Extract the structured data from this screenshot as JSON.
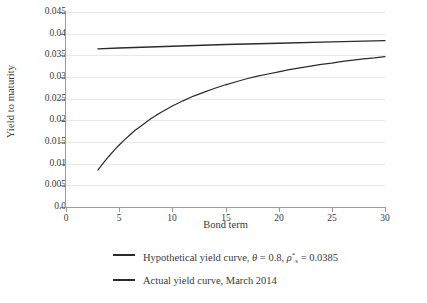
{
  "chart_data": {
    "type": "line",
    "title": "",
    "xlabel": "Bond term",
    "ylabel": "Yield to maturity",
    "xlim": [
      0,
      30
    ],
    "ylim": [
      0,
      0.045
    ],
    "grid": "horizontal",
    "legend_position": "below",
    "x_ticks": [
      "0",
      "5",
      "10",
      "15",
      "20",
      "25",
      "30"
    ],
    "x_tick_values": [
      0,
      5,
      10,
      15,
      20,
      25,
      30
    ],
    "y_ticks": [
      "0.0",
      "0.005",
      "0.01",
      "0.015",
      "0.02",
      "0.025",
      "0.03",
      "0.035",
      "0.04",
      "0.045"
    ],
    "y_tick_values": [
      0,
      0.005,
      0.01,
      0.015,
      0.02,
      0.025,
      0.03,
      0.035,
      0.04,
      0.045
    ],
    "series": [
      {
        "name": "Hypothetical yield curve, θ = 0.8, ρ*ₛ = 0.0385",
        "color": "#2b2b2b",
        "x": [
          3,
          3.5,
          4,
          4.5,
          5,
          5.5,
          6,
          6.5,
          7,
          7.5,
          8,
          8.5,
          9,
          9.5,
          10,
          11,
          12,
          13,
          14,
          15,
          16,
          17,
          18,
          19,
          20,
          21,
          22,
          23,
          24,
          25,
          26,
          27,
          28,
          29,
          30
        ],
        "y": [
          0.0085,
          0.0101,
          0.0116,
          0.013,
          0.0143,
          0.0155,
          0.0166,
          0.0177,
          0.0186,
          0.0195,
          0.0204,
          0.0212,
          0.0219,
          0.0226,
          0.0233,
          0.0245,
          0.0256,
          0.0265,
          0.0274,
          0.0282,
          0.0289,
          0.0296,
          0.0302,
          0.0307,
          0.0312,
          0.0317,
          0.0321,
          0.0325,
          0.0329,
          0.0332,
          0.0336,
          0.0339,
          0.0342,
          0.0344,
          0.0347
        ]
      },
      {
        "name": "Actual yield curve, March 2014",
        "color": "#2b2b2b",
        "x": [
          3,
          5,
          10,
          15,
          20,
          25,
          30
        ],
        "y": [
          0.0365,
          0.0367,
          0.0371,
          0.0375,
          0.0378,
          0.0381,
          0.0384
        ]
      }
    ]
  },
  "axes": {
    "y_title": "Yield to maturity",
    "x_title": "Bond term"
  },
  "legend": {
    "items": [
      {
        "prefix": "Hypothetical yield curve, ",
        "theta_symbol": "θ",
        "theta_eq": " = 0.8, ",
        "rho_symbol": "ρ",
        "rho_sub": "s",
        "rho_sup": "*",
        "rho_eq": " = 0.0385",
        "full_text": "Hypothetical yield curve, θ = 0.8, ρ*ₛ = 0.0385"
      },
      {
        "full_text": "Actual yield curve, March 2014"
      }
    ]
  },
  "colors": {
    "curve": "#2b2b2b",
    "gridline": "#e8e8e8",
    "axis": "#9a9a9a",
    "text": "#3a3a3a",
    "background": "#ffffff"
  }
}
